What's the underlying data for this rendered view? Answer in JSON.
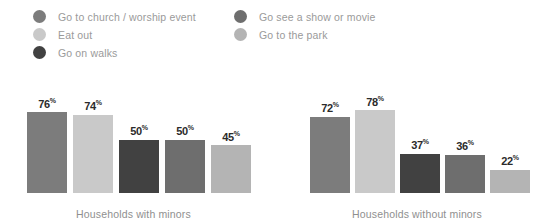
{
  "legend": {
    "columns": [
      {
        "items": [
          {
            "label": "Go to church / worship event",
            "color": "#7c7c7c",
            "icon": "legend-dot-icon"
          },
          {
            "label": "Eat out",
            "color": "#c9c9c9",
            "icon": "legend-dot-icon"
          },
          {
            "label": "Go on walks",
            "color": "#414141",
            "icon": "legend-dot-icon"
          }
        ]
      },
      {
        "items": [
          {
            "label": "Go see a show or movie",
            "color": "#6e6e6e",
            "icon": "legend-dot-icon"
          },
          {
            "label": "Go to the park",
            "color": "#b4b4b4",
            "icon": "legend-dot-icon"
          }
        ]
      }
    ]
  },
  "chart_data": {
    "type": "bar",
    "title": "",
    "subtitle": "",
    "xlabel": "",
    "ylabel": "",
    "ylim": [
      0,
      100
    ],
    "grid": false,
    "legend_position": "top",
    "value_suffix": "%",
    "categories": [
      "Households with minors",
      "Households without minors"
    ],
    "series": [
      {
        "name": "Go to church / worship event",
        "color": "#7c7c7c",
        "values": [
          76,
          72
        ]
      },
      {
        "name": "Eat out",
        "color": "#c9c9c9",
        "values": [
          74,
          78
        ]
      },
      {
        "name": "Go on walks",
        "color": "#414141",
        "values": [
          50,
          37
        ]
      },
      {
        "name": "Go see a show or movie",
        "color": "#6e6e6e",
        "values": [
          50,
          36
        ]
      },
      {
        "name": "Go to the park",
        "color": "#b4b4b4",
        "values": [
          45,
          22
        ]
      }
    ],
    "groups": [
      {
        "label": "Households with minors",
        "bars": [
          {
            "series": "Go to church / worship event",
            "value": 76,
            "value_label": "76",
            "pct": "%",
            "color": "#7c7c7c"
          },
          {
            "series": "Eat out",
            "value": 74,
            "value_label": "74",
            "pct": "%",
            "color": "#c9c9c9"
          },
          {
            "series": "Go on walks",
            "value": 50,
            "value_label": "50",
            "pct": "%",
            "color": "#414141"
          },
          {
            "series": "Go see a show or movie",
            "value": 50,
            "value_label": "50",
            "pct": "%",
            "color": "#6e6e6e"
          },
          {
            "series": "Go to the park",
            "value": 45,
            "value_label": "45",
            "pct": "%",
            "color": "#b4b4b4"
          }
        ]
      },
      {
        "label": "Households without minors",
        "bars": [
          {
            "series": "Go to church / worship event",
            "value": 72,
            "value_label": "72",
            "pct": "%",
            "color": "#7c7c7c"
          },
          {
            "series": "Eat out",
            "value": 78,
            "value_label": "78",
            "pct": "%",
            "color": "#c9c9c9"
          },
          {
            "series": "Go on walks",
            "value": 37,
            "value_label": "37",
            "pct": "%",
            "color": "#414141"
          },
          {
            "series": "Go see a show or movie",
            "value": 36,
            "value_label": "36",
            "pct": "%",
            "color": "#6e6e6e"
          },
          {
            "series": "Go to the park",
            "value": 22,
            "value_label": "22",
            "pct": "%",
            "color": "#b4b4b4"
          }
        ]
      }
    ]
  }
}
